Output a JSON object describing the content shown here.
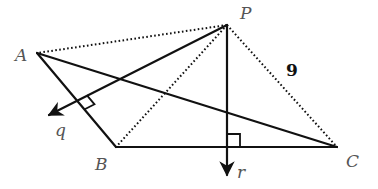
{
  "diagram": {
    "points": {
      "P": {
        "label": "P",
        "x": 227,
        "y": 25
      },
      "A": {
        "label": "A",
        "x": 37,
        "y": 53
      },
      "B": {
        "label": "B",
        "x": 116,
        "y": 147
      },
      "C": {
        "label": "C",
        "x": 337,
        "y": 147
      }
    },
    "vectors": {
      "q": {
        "label": "q",
        "from": "P",
        "tip": {
          "x": 47,
          "y": 116
        }
      },
      "r": {
        "label": "r",
        "from": "P",
        "tip": {
          "x": 227,
          "y": 177
        }
      }
    },
    "solid_segments": [
      "A-B",
      "B-C",
      "A-C",
      "P-q",
      "P-r"
    ],
    "dotted_segments": [
      "P-A",
      "P-B",
      "P-C"
    ],
    "right_angles": [
      "q ⟂ AB",
      "r ⟂ BC"
    ],
    "measurement": {
      "segment": "P-C",
      "value": "9"
    }
  }
}
